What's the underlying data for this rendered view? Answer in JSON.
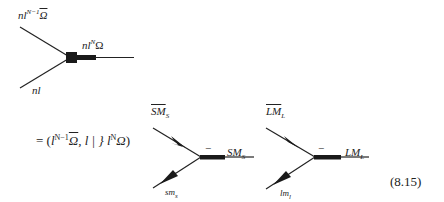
{
  "top_vertex": {
    "label_upper": {
      "base": "nl",
      "sup": "N−1",
      "sym": "Ω",
      "sym_bar": true
    },
    "label_right": {
      "base": "nl",
      "sup": "N",
      "sym": "Ω"
    },
    "label_lower": "nl"
  },
  "equation": {
    "prefix": "= (",
    "l1": "l",
    "l1_sup": "N−1",
    "omega_bar": "Ω",
    "middle": ", l | } ",
    "l2": "l",
    "l2_sup": "N",
    "omega": "Ω",
    "suffix": ")"
  },
  "spin_vertex": {
    "label_upper": "SM",
    "label_upper_sub": "S",
    "label_right": "SM",
    "label_right_sub": "S",
    "label_lower": "sm",
    "label_lower_sub": "s",
    "sign": "−"
  },
  "orbital_vertex": {
    "label_upper": "LM",
    "label_upper_sub": "L",
    "label_right": "LM",
    "label_right_sub": "L",
    "label_lower": "lm",
    "label_lower_sub": "l",
    "sign": "−"
  },
  "equation_number": "(8.15)",
  "colors": {
    "ink": "#222222",
    "background": "#ffffff"
  }
}
